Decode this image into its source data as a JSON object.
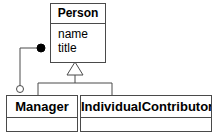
{
  "diagram": {
    "kind": "uml-class-diagram",
    "background_color": "#ffffff",
    "line_color": "#4a4a4a",
    "text_color": "#000000",
    "width": 218,
    "height": 135
  },
  "classes": {
    "person": {
      "name": "Person",
      "attributes": [
        "name",
        "title"
      ]
    },
    "manager": {
      "name": "Manager",
      "attributes": []
    },
    "individual_contributor": {
      "name": "IndividualContributor",
      "attributes": []
    }
  },
  "relationships": [
    {
      "id": "generalization-manager",
      "type": "generalization",
      "marker": "hollow-triangle",
      "source": "Manager",
      "target": "Person",
      "label": ""
    },
    {
      "id": "generalization-individualcontributor",
      "type": "generalization",
      "marker": "hollow-triangle",
      "source": "IndividualContributor",
      "target": "Person",
      "label": ""
    },
    {
      "id": "composition-person-manager",
      "type": "composition",
      "source_marker": "filled-circle",
      "target_marker": "hollow-circle",
      "source": "Person",
      "target": "Manager",
      "label": ""
    }
  ]
}
